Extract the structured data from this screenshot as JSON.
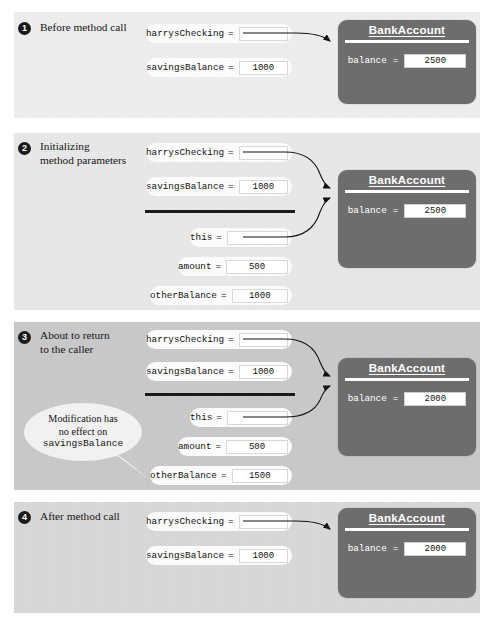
{
  "figure": {
    "object_class_name": "BankAccount",
    "field_label": "balance",
    "equals": "=",
    "callout": {
      "line1": "Modification has",
      "line2": "no effect on",
      "line3": "savingsBalance"
    }
  },
  "steps": [
    {
      "number": "1",
      "caption_line1": "Before method call",
      "caption_line2": "",
      "locals": [
        {
          "name": "harrysChecking",
          "value": ""
        },
        {
          "name": "savingsBalance",
          "value": "1000"
        }
      ],
      "params": [],
      "object": {
        "title": "BankAccount",
        "field": "balance",
        "value": "2500"
      }
    },
    {
      "number": "2",
      "caption_line1": "Initializing",
      "caption_line2": "method parameters",
      "locals": [
        {
          "name": "harrysChecking",
          "value": ""
        },
        {
          "name": "savingsBalance",
          "value": "1000"
        }
      ],
      "params": [
        {
          "name": "this",
          "value": ""
        },
        {
          "name": "amount",
          "value": "500"
        },
        {
          "name": "otherBalance",
          "value": "1000"
        }
      ],
      "object": {
        "title": "BankAccount",
        "field": "balance",
        "value": "2500"
      }
    },
    {
      "number": "3",
      "caption_line1": "About to return",
      "caption_line2": "to the caller",
      "locals": [
        {
          "name": "harrysChecking",
          "value": ""
        },
        {
          "name": "savingsBalance",
          "value": "1000"
        }
      ],
      "params": [
        {
          "name": "this",
          "value": ""
        },
        {
          "name": "amount",
          "value": "500"
        },
        {
          "name": "otherBalance",
          "value": "1500"
        }
      ],
      "object": {
        "title": "BankAccount",
        "field": "balance",
        "value": "2000"
      }
    },
    {
      "number": "4",
      "caption_line1": "After method call",
      "caption_line2": "",
      "locals": [
        {
          "name": "harrysChecking",
          "value": ""
        },
        {
          "name": "savingsBalance",
          "value": "1000"
        }
      ],
      "params": [],
      "object": {
        "title": "BankAccount",
        "field": "balance",
        "value": "2000"
      }
    }
  ],
  "colors": {
    "object_box": "#6d6d6d",
    "panel_light": "#efefef",
    "panel_dark": "#c9c9c9",
    "badge": "#1b1b1b",
    "arrow": "#111111"
  }
}
